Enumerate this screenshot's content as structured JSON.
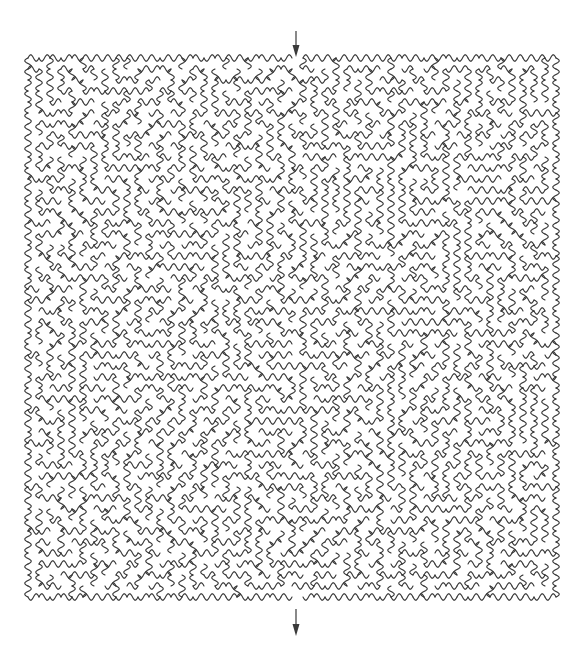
{
  "document": {
    "title": "Curvy Maze Puzzle",
    "type": "maze",
    "background_color": "#ffffff"
  },
  "canvas": {
    "width": 585,
    "height": 651
  },
  "maze": {
    "style": "curvy-wiggly-walls",
    "shape": "square",
    "columns": 48,
    "rows": 49,
    "cell_size": 11,
    "origin_x": 28,
    "origin_y": 58,
    "width": 528,
    "height": 539,
    "wall_color": "#333333",
    "wall_width": 1.1,
    "wall_waviness": 0.3,
    "random_seed": 20240517,
    "entrance_column": 24,
    "exit_column": 24,
    "entrance_label": "entrance",
    "exit_label": "exit"
  },
  "entrance_arrow": {
    "name": "entrance-arrow",
    "direction": "down",
    "x": 296,
    "y_start": 31,
    "y_end": 57,
    "color": "#3a3a3a",
    "shaft_width": 1.2,
    "head_width": 7,
    "head_length": 12,
    "label": "Entrance"
  },
  "exit_arrow": {
    "name": "exit-arrow",
    "direction": "down",
    "x": 296,
    "y_start": 609,
    "y_end": 636,
    "color": "#3a3a3a",
    "shaft_width": 1.2,
    "head_width": 7,
    "head_length": 12,
    "label": "Exit"
  },
  "accessibility": {
    "description": "A square curvy maze with wavy walls. An arrow at the top center points down into the entrance, and an arrow at the bottom center points down out of the exit."
  }
}
